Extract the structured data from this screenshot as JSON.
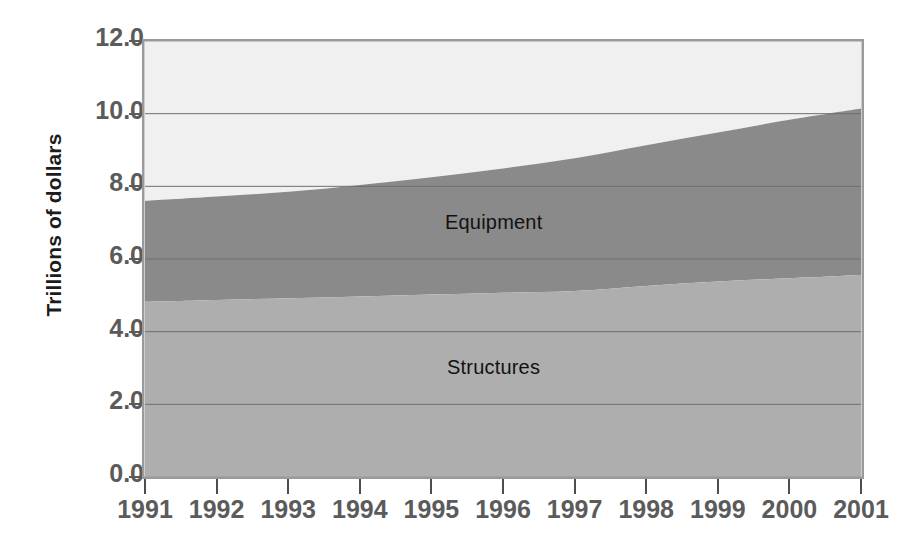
{
  "chart_data": {
    "type": "area",
    "stacked": true,
    "title": "",
    "subtitle": "",
    "xlabel": "",
    "ylabel": "Trillions of dollars",
    "x": [
      1991,
      1992,
      1993,
      1994,
      1995,
      1996,
      1997,
      1998,
      1999,
      2000,
      2001
    ],
    "categories": [
      "1991",
      "1992",
      "1993",
      "1994",
      "1995",
      "1996",
      "1997",
      "1998",
      "1999",
      "2000",
      "2001"
    ],
    "xlim": [
      1991,
      2001
    ],
    "ylim": [
      0.0,
      12.0
    ],
    "ytick_labels": [
      "0.0",
      "2.0",
      "4.0",
      "6.0",
      "8.0",
      "10.0",
      "12.0"
    ],
    "ytick_values": [
      0.0,
      2.0,
      4.0,
      6.0,
      8.0,
      10.0,
      12.0
    ],
    "grid": true,
    "grid_axis": "y",
    "legend_position": "inside-labels",
    "series": [
      {
        "name": "Structures",
        "color": "#aeaeae",
        "label_text": "Structures",
        "values": [
          4.82,
          4.87,
          4.92,
          4.97,
          5.02,
          5.07,
          5.12,
          5.26,
          5.38,
          5.47,
          5.56
        ]
      },
      {
        "name": "Equipment",
        "color": "#8a8a8a",
        "label_text": "Equipment",
        "values": [
          2.78,
          2.85,
          2.93,
          3.07,
          3.23,
          3.42,
          3.65,
          3.87,
          4.1,
          4.36,
          4.58
        ]
      },
      {
        "name": "Remainder",
        "color": "#f0f0f0",
        "label_text": "",
        "values": [
          4.4,
          4.28,
          4.15,
          3.96,
          3.75,
          3.51,
          3.23,
          2.87,
          2.52,
          2.17,
          1.86
        ]
      }
    ],
    "cumulative_totals": {
      "structures_top": [
        4.82,
        4.87,
        4.92,
        4.97,
        5.02,
        5.07,
        5.12,
        5.26,
        5.38,
        5.47,
        5.56
      ],
      "equipment_top": [
        7.6,
        7.72,
        7.85,
        8.04,
        8.25,
        8.49,
        8.77,
        9.13,
        9.48,
        9.83,
        10.14
      ],
      "chart_top": [
        12.0,
        12.0,
        12.0,
        12.0,
        12.0,
        12.0,
        12.0,
        12.0,
        12.0,
        12.0,
        12.0
      ]
    },
    "annotations": [
      {
        "text": "Equipment",
        "x": 1996,
        "y": 7.0
      },
      {
        "text": "Structures",
        "x": 1996,
        "y": 3.0
      }
    ],
    "colors": {
      "structures": "#aeaeae",
      "equipment": "#8a8a8a",
      "remainder": "#f0f0f0",
      "plot_border": "#9a9a9a",
      "gridline": "#6f6f6f",
      "tick_text": "#5b5b5b",
      "axis_title": "#1c1c1c",
      "annotation_text": "#121212",
      "background": "#ffffff"
    }
  }
}
